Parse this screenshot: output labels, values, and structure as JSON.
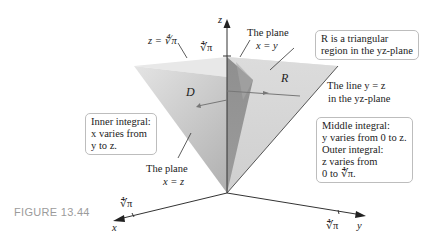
{
  "figure": {
    "caption": "FIGURE 13.44",
    "axes": {
      "z_label": "z",
      "y_label": "y",
      "x_label": "x",
      "z_tick": "∜π",
      "y_tick": "∜π",
      "x_tick": "∜π"
    },
    "labels": {
      "z_plane": "z = ∜π",
      "plane_xy_line1": "The plane",
      "plane_xy_line2": "x = y",
      "region_D": "D",
      "region_R": "R",
      "line_yz_line1": "The line y = z",
      "line_yz_line2": "in the yz-plane",
      "plane_xz_line1": "The plane",
      "plane_xz_line2": "x = z"
    },
    "boxes": {
      "R_box": [
        "R is a triangular",
        "region in the yz-plane"
      ],
      "inner_box": [
        "Inner integral:",
        "x varies from",
        "y to z."
      ],
      "middle_outer_box": [
        "Middle integral:",
        "y varies from 0 to z.",
        "Outer integral:",
        "z varies from",
        "0 to ∜π."
      ]
    },
    "colors": {
      "face_light": "#e2e2e2",
      "face_mid": "#cfcfcf",
      "face_dark": "#9e9e9e",
      "axis": "#333333",
      "box_border": "#bdbdbd",
      "caption": "#9b9b9b"
    }
  }
}
